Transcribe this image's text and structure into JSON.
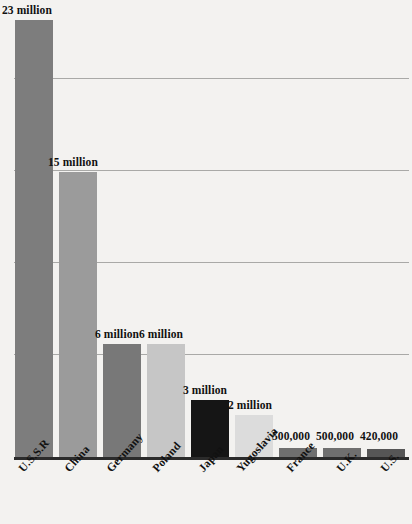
{
  "chart_data": {
    "type": "bar",
    "title": "",
    "subtitle": "",
    "xlabel": "",
    "ylabel": "",
    "categories": [
      "U.S.S.R",
      "China",
      "Germany",
      "Poland",
      "Japan",
      "Yugoslavia",
      "France",
      "U.K.",
      "U.S."
    ],
    "values": [
      23000000,
      15000000,
      6000000,
      6000000,
      3000000,
      2000000,
      500000,
      500000,
      420000
    ],
    "value_labels": [
      "23 million",
      "15 million",
      "6 million",
      "6 million",
      "3 million",
      "2 million",
      "500,000",
      "500,000",
      "420,000"
    ],
    "ylim": [
      0,
      24000000
    ],
    "gridlines": [
      6000000,
      12000000,
      18000000,
      24000000
    ],
    "grid": true,
    "legend": "none",
    "bar_colors": [
      "#7d7d7d",
      "#9b9b9b",
      "#787878",
      "#c6c6c6",
      "#151515",
      "#dcdcdc",
      "#6f6f6f",
      "#6f6f6f",
      "#565656"
    ],
    "axis_color": "#2b2b2b",
    "grid_color": "#a9a9a7",
    "background": "#f3f2f0",
    "text_color": "#111111"
  },
  "bars": [
    {
      "category": "U.S.S.R",
      "label": "23 million",
      "value": 23000000,
      "x": 15,
      "width": 38,
      "top": 20,
      "color": "#7d7d7d",
      "label_x": 2,
      "label_y": 4
    },
    {
      "category": "China",
      "label": "15 million",
      "value": 15000000,
      "x": 59,
      "width": 38,
      "top": 172,
      "color": "#9b9b9b",
      "label_x": 48,
      "label_y": 156
    },
    {
      "category": "Germany",
      "label": "6 million",
      "value": 6000000,
      "x": 103,
      "width": 38,
      "top": 344,
      "color": "#787878",
      "label_x": 95,
      "label_y": 328
    },
    {
      "category": "Poland",
      "label": "6 million",
      "value": 6000000,
      "x": 147,
      "width": 38,
      "top": 344,
      "color": "#c6c6c6",
      "label_x": 139,
      "label_y": 328
    },
    {
      "category": "Japan",
      "label": "3 million",
      "value": 3000000,
      "x": 191,
      "width": 38,
      "top": 400,
      "color": "#151515",
      "label_x": 183,
      "label_y": 384
    },
    {
      "category": "Yugoslavia",
      "label": "2 million",
      "value": 2000000,
      "x": 235,
      "width": 38,
      "top": 415,
      "color": "#dcdcdc",
      "label_x": 228,
      "label_y": 399
    },
    {
      "category": "France",
      "label": "500,000",
      "value": 500000,
      "x": 279,
      "width": 38,
      "top": 448,
      "color": "#6f6f6f",
      "label_x": 272,
      "label_y": 430
    },
    {
      "category": "U.K.",
      "label": "500,000",
      "value": 500000,
      "x": 323,
      "width": 38,
      "top": 448,
      "color": "#6f6f6f",
      "label_x": 316,
      "label_y": 430
    },
    {
      "category": "U.S.",
      "label": "420,000",
      "value": 420000,
      "x": 367,
      "width": 38,
      "top": 449,
      "color": "#565656",
      "label_x": 360,
      "label_y": 430
    }
  ],
  "category_labels": [
    {
      "text": "U.S.S.R",
      "x": 16,
      "y": 466
    },
    {
      "text": "China",
      "x": 62,
      "y": 466
    },
    {
      "text": "Germany",
      "x": 104,
      "y": 466
    },
    {
      "text": "Poland",
      "x": 150,
      "y": 466
    },
    {
      "text": "Japan",
      "x": 196,
      "y": 466
    },
    {
      "text": "Yugoslavia",
      "x": 234,
      "y": 466
    },
    {
      "text": "France",
      "x": 284,
      "y": 466
    },
    {
      "text": "U.K.",
      "x": 334,
      "y": 466
    },
    {
      "text": "U.S.",
      "x": 378,
      "y": 466
    }
  ],
  "gridlines": [
    {
      "y": 78
    },
    {
      "y": 170
    },
    {
      "y": 262
    },
    {
      "y": 354
    }
  ]
}
